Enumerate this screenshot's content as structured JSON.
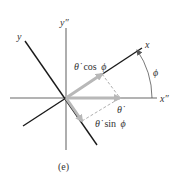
{
  "figure": {
    "caption": "(e)",
    "axes": {
      "x_double_prime": "x″",
      "y_double_prime": "y″",
      "x": "x",
      "y": "y"
    },
    "angle_label": "ϕ",
    "vectors": {
      "theta_dot": "θ̇",
      "theta_dot_cos_phi": {
        "symbol": "θ̇",
        "func": "cos",
        "arg": "ϕ"
      },
      "theta_dot_sin_phi": {
        "symbol": "θ̇",
        "func": "sin",
        "arg": "ϕ"
      }
    },
    "colors": {
      "fixed_axes": "#9a9a9a",
      "rotated_axes": "#1a1a1a",
      "vector": "#b8b8b8",
      "dashed": "#9a9a9a",
      "text": "#333333"
    }
  }
}
